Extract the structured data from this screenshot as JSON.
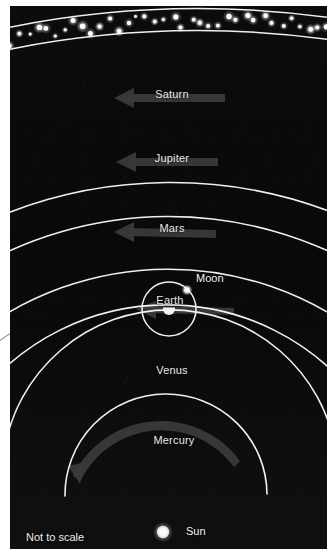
{
  "figure": {
    "caption": "Not to scale",
    "background_color": "#0a0a0a",
    "orbit_color": "#f0f0f0",
    "label_color": "#ededed",
    "arrow_color": "#3c3c3c"
  },
  "sun": {
    "label": "Sun",
    "color": "#f4f4f0",
    "cx": 163,
    "cy": 532,
    "r": 6
  },
  "asteroid_belt": {
    "label": "",
    "dot_color": "#ffffff",
    "inner_arc_y": 42,
    "outer_arc_y": 20,
    "dot_count": 44
  },
  "orbits": [
    {
      "name": "Mercury",
      "label": "Mercury",
      "label_x": 172,
      "label_y": 434,
      "radius": 98,
      "has_arrow": true
    },
    {
      "name": "Venus",
      "label": "Venus",
      "label_x": 172,
      "label_y": 364,
      "radius": 168,
      "has_arrow": false
    },
    {
      "name": "Earth",
      "label": "Earth",
      "label_x": 172,
      "label_y": 292,
      "radius": 240,
      "has_arrow": true
    },
    {
      "name": "Mars",
      "label": "Mars",
      "label_x": 172,
      "label_y": 216,
      "radius": 316,
      "has_arrow": true
    },
    {
      "name": "Jupiter",
      "label": "Jupiter",
      "label_x": 172,
      "label_y": 146,
      "radius": 386,
      "has_arrow": true
    },
    {
      "name": "Saturn",
      "label": "Saturn",
      "label_x": 172,
      "label_y": 82,
      "radius": 450,
      "has_arrow": true
    }
  ],
  "earth": {
    "label": "Earth",
    "cx": 169,
    "cy": 309,
    "r": 4,
    "color": "#f2f2f2"
  },
  "moon": {
    "label": "Moon",
    "label_x": 196,
    "label_y": 272,
    "cx": 186,
    "cy": 289,
    "r": 2.6,
    "color": "#ffffff",
    "orbit_radius": 27,
    "orbit_color": "#f0f0f0"
  },
  "labels": {
    "sun": "Sun",
    "moon": "Moon",
    "earth": "Earth",
    "not_to_scale": "Not to scale"
  }
}
